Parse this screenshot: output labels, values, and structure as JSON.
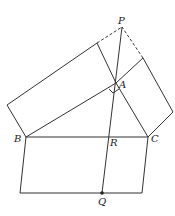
{
  "diagram": {
    "type": "geometry",
    "points": {
      "P": {
        "label": "P",
        "x": 122,
        "y": 27
      },
      "A": {
        "label": "A",
        "x": 116,
        "y": 83
      },
      "B": {
        "label": "B",
        "x": 26,
        "y": 137
      },
      "C": {
        "label": "C",
        "x": 148,
        "y": 137
      },
      "R": {
        "label": "R",
        "x": 108,
        "y": 137
      },
      "Q": {
        "label": "Q",
        "x": 102,
        "y": 193
      }
    },
    "labels": {
      "P": "P",
      "A": "A",
      "B": "B",
      "C": "C",
      "R": "R",
      "Q": "Q"
    }
  }
}
